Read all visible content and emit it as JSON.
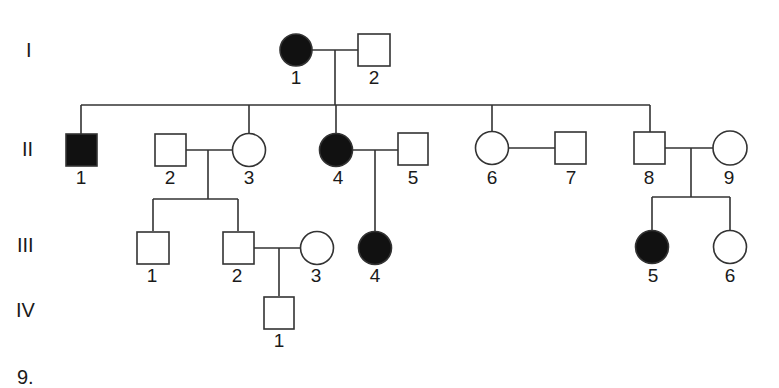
{
  "figure_number": "9.",
  "colors": {
    "affected": "#111111",
    "unaffected": "#ffffff",
    "line": "#333333"
  },
  "generations": [
    {
      "label": "I",
      "y": 50
    },
    {
      "label": "II",
      "y": 150
    },
    {
      "label": "III",
      "y": 248
    },
    {
      "label": "IV",
      "y": 312
    }
  ],
  "individuals": [
    {
      "id": "I-1",
      "number": "1",
      "sex": "female",
      "affected": true
    },
    {
      "id": "I-2",
      "number": "2",
      "sex": "male",
      "affected": false
    },
    {
      "id": "II-1",
      "number": "1",
      "sex": "male",
      "affected": true
    },
    {
      "id": "II-2",
      "number": "2",
      "sex": "male",
      "affected": false
    },
    {
      "id": "II-3",
      "number": "3",
      "sex": "female",
      "affected": false
    },
    {
      "id": "II-4",
      "number": "4",
      "sex": "female",
      "affected": true
    },
    {
      "id": "II-5",
      "number": "5",
      "sex": "male",
      "affected": false
    },
    {
      "id": "II-6",
      "number": "6",
      "sex": "female",
      "affected": false
    },
    {
      "id": "II-7",
      "number": "7",
      "sex": "male",
      "affected": false
    },
    {
      "id": "II-8",
      "number": "8",
      "sex": "male",
      "affected": false
    },
    {
      "id": "II-9",
      "number": "9",
      "sex": "female",
      "affected": false
    },
    {
      "id": "III-1",
      "number": "1",
      "sex": "male",
      "affected": false
    },
    {
      "id": "III-2",
      "number": "2",
      "sex": "male",
      "affected": false
    },
    {
      "id": "III-3",
      "number": "3",
      "sex": "female",
      "affected": false
    },
    {
      "id": "III-4",
      "number": "4",
      "sex": "female",
      "affected": true
    },
    {
      "id": "III-5",
      "number": "5",
      "sex": "female",
      "affected": true
    },
    {
      "id": "III-6",
      "number": "6",
      "sex": "female",
      "affected": false
    },
    {
      "id": "IV-1",
      "number": "1",
      "sex": "male",
      "affected": false
    }
  ],
  "matings": [
    {
      "partners": [
        "I-1",
        "I-2"
      ],
      "children": [
        "II-1",
        "II-3",
        "II-4",
        "II-6",
        "II-8"
      ]
    },
    {
      "partners": [
        "II-2",
        "II-3"
      ],
      "children": [
        "III-1",
        "III-2"
      ]
    },
    {
      "partners": [
        "II-4",
        "II-5"
      ],
      "children": [
        "III-4"
      ]
    },
    {
      "partners": [
        "II-6",
        "II-7"
      ],
      "children": []
    },
    {
      "partners": [
        "II-8",
        "II-9"
      ],
      "children": [
        "III-5",
        "III-6"
      ]
    },
    {
      "partners": [
        "III-2",
        "III-3"
      ],
      "children": [
        "IV-1"
      ]
    }
  ]
}
